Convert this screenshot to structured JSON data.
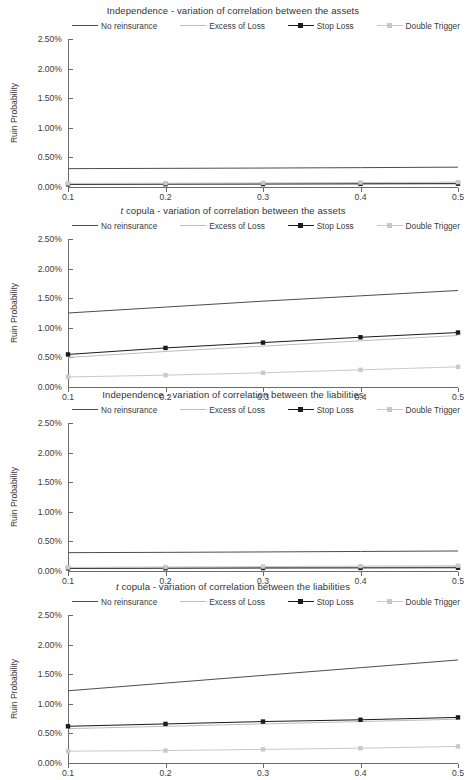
{
  "figure": {
    "ylabel": "Ruin Probability",
    "yticks": [
      "0.00%",
      "0.50%",
      "1.00%",
      "1.50%",
      "2.00%",
      "2.50%"
    ],
    "xticks": [
      "0.1",
      "0.2",
      "0.3",
      "0.4",
      "0.5"
    ],
    "legend": [
      {
        "label": "No reinsurance",
        "color": "#4d4d4d",
        "marker": "none"
      },
      {
        "label": "Excess of Loss",
        "color": "#bdbdbd",
        "marker": "none"
      },
      {
        "label": "Stop Loss",
        "color": "#1a1a1a",
        "marker": "square"
      },
      {
        "label": "Double Trigger",
        "color": "#c9c9c9",
        "marker": "square"
      }
    ],
    "caption": ""
  },
  "chart_data": [
    {
      "type": "line",
      "title_prefix": "",
      "title": "Independence - variation of correlation between the assets",
      "xlabel": "",
      "ylabel": "Ruin Probability",
      "x": [
        0.1,
        0.2,
        0.3,
        0.4,
        0.5
      ],
      "xlim": [
        0.1,
        0.5
      ],
      "ylim": [
        0.0,
        2.5
      ],
      "grid": false,
      "legend_position": "top",
      "series": [
        {
          "name": "No reinsurance",
          "values": [
            0.31,
            0.315,
            0.32,
            0.327,
            0.335
          ],
          "color": "#4d4d4d",
          "marker": "none"
        },
        {
          "name": "Excess of Loss",
          "values": [
            0.05,
            0.055,
            0.058,
            0.062,
            0.068
          ],
          "color": "#bdbdbd",
          "marker": "none"
        },
        {
          "name": "Stop Loss",
          "values": [
            0.045,
            0.048,
            0.05,
            0.053,
            0.056
          ],
          "color": "#1a1a1a",
          "marker": "square"
        },
        {
          "name": "Double Trigger",
          "values": [
            0.06,
            0.065,
            0.07,
            0.075,
            0.082
          ],
          "color": "#c9c9c9",
          "marker": "square"
        }
      ]
    },
    {
      "type": "line",
      "title_prefix": "t",
      "title": " copula - variation of correlation between the assets",
      "xlabel": "",
      "ylabel": "Ruin Probability",
      "x": [
        0.1,
        0.2,
        0.3,
        0.4,
        0.5
      ],
      "xlim": [
        0.1,
        0.5
      ],
      "ylim": [
        0.0,
        2.5
      ],
      "grid": false,
      "legend_position": "top",
      "series": [
        {
          "name": "No reinsurance",
          "values": [
            1.25,
            1.35,
            1.45,
            1.54,
            1.63
          ],
          "color": "#4d4d4d",
          "marker": "none"
        },
        {
          "name": "Excess of Loss",
          "values": [
            0.5,
            0.6,
            0.69,
            0.78,
            0.87
          ],
          "color": "#bdbdbd",
          "marker": "none"
        },
        {
          "name": "Stop Loss",
          "values": [
            0.55,
            0.66,
            0.75,
            0.84,
            0.92
          ],
          "color": "#1a1a1a",
          "marker": "square"
        },
        {
          "name": "Double Trigger",
          "values": [
            0.17,
            0.2,
            0.24,
            0.29,
            0.34
          ],
          "color": "#c9c9c9",
          "marker": "square"
        }
      ]
    },
    {
      "type": "line",
      "title_prefix": "",
      "title": "Independence - variation of correlation between the liabilities",
      "xlabel": "",
      "ylabel": "Ruin Probability",
      "x": [
        0.1,
        0.2,
        0.3,
        0.4,
        0.5
      ],
      "xlim": [
        0.1,
        0.5
      ],
      "ylim": [
        0.0,
        2.5
      ],
      "grid": false,
      "legend_position": "top",
      "series": [
        {
          "name": "No reinsurance",
          "values": [
            0.31,
            0.315,
            0.322,
            0.33,
            0.338
          ],
          "color": "#4d4d4d",
          "marker": "none"
        },
        {
          "name": "Excess of Loss",
          "values": [
            0.05,
            0.055,
            0.06,
            0.065,
            0.07
          ],
          "color": "#bdbdbd",
          "marker": "none"
        },
        {
          "name": "Stop Loss",
          "values": [
            0.045,
            0.047,
            0.05,
            0.052,
            0.055
          ],
          "color": "#1a1a1a",
          "marker": "square"
        },
        {
          "name": "Double Trigger",
          "values": [
            0.06,
            0.068,
            0.075,
            0.082,
            0.09
          ],
          "color": "#c9c9c9",
          "marker": "square"
        }
      ]
    },
    {
      "type": "line",
      "title_prefix": "t",
      "title": " copula - variation of correlation between the liabilities",
      "xlabel": "",
      "ylabel": "Ruin Probability",
      "x": [
        0.1,
        0.2,
        0.3,
        0.4,
        0.5
      ],
      "xlim": [
        0.1,
        0.5
      ],
      "ylim": [
        0.0,
        2.5
      ],
      "grid": false,
      "legend_position": "top",
      "series": [
        {
          "name": "No reinsurance",
          "values": [
            1.22,
            1.35,
            1.48,
            1.61,
            1.74
          ],
          "color": "#4d4d4d",
          "marker": "none"
        },
        {
          "name": "Excess of Loss",
          "values": [
            0.58,
            0.62,
            0.66,
            0.7,
            0.74
          ],
          "color": "#bdbdbd",
          "marker": "none"
        },
        {
          "name": "Stop Loss",
          "values": [
            0.62,
            0.66,
            0.7,
            0.73,
            0.77
          ],
          "color": "#1a1a1a",
          "marker": "square"
        },
        {
          "name": "Double Trigger",
          "values": [
            0.2,
            0.21,
            0.23,
            0.25,
            0.28
          ],
          "color": "#c9c9c9",
          "marker": "square"
        }
      ]
    }
  ]
}
